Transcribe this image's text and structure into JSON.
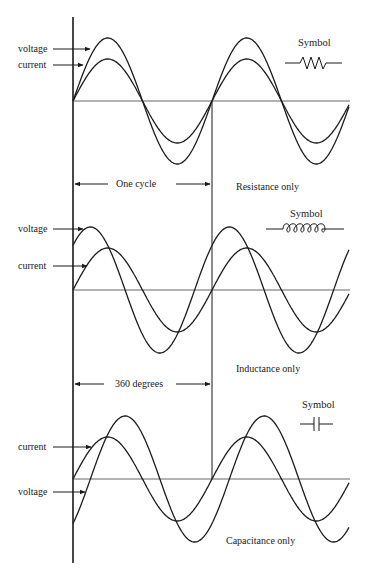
{
  "diagram": {
    "geometry": {
      "x0": 73,
      "x_end": 349,
      "period_px": 139,
      "v_amp": 63,
      "i_amp": 42,
      "axis_top": 17,
      "axis_bottom": 563,
      "cycle_marker_x": 212
    },
    "panels": [
      {
        "id": "resistance",
        "caption": "Resistance only",
        "symbol_label": "Symbol",
        "symbol_type": "resistor",
        "baseline_y": 101,
        "labels": [
          {
            "text": "voltage",
            "y": 52,
            "target_x": 92
          },
          {
            "text": "current",
            "y": 68,
            "target_x": 84
          }
        ],
        "voltage_phase_deg": 0,
        "current_phase_deg": 0,
        "span_label": "One cycle",
        "span_y": 184
      },
      {
        "id": "inductance",
        "caption": "Inductance only",
        "symbol_label": "Symbol",
        "symbol_type": "inductor",
        "baseline_y": 290,
        "labels": [
          {
            "text": "voltage",
            "y": 229,
            "target_x": 84
          },
          {
            "text": "current",
            "y": 266,
            "target_x": 88
          }
        ],
        "voltage_phase_deg": 45,
        "current_phase_deg": 0,
        "span_label": "360 degrees",
        "span_y": 384
      },
      {
        "id": "capacitance",
        "caption": "Capacitance only",
        "symbol_label": "Symbol",
        "symbol_type": "capacitor",
        "baseline_y": 479,
        "labels": [
          {
            "text": "current",
            "y": 447,
            "target_x": 92
          },
          {
            "text": "voltage",
            "y": 492,
            "target_x": 86
          }
        ],
        "voltage_phase_deg": -45,
        "current_phase_deg": 0
      }
    ]
  }
}
